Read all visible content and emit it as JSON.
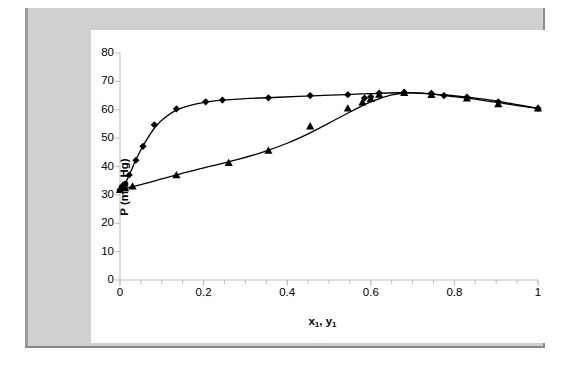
{
  "chart_data": {
    "type": "scatter",
    "title": "",
    "xlabel": "x1, y1",
    "ylabel": "P (mm Hg)",
    "xlim": [
      0,
      1
    ],
    "ylim": [
      0,
      80
    ],
    "grid": false,
    "legend": "none",
    "x_ticks": [
      "0",
      "0.2",
      "0.4",
      "0.6",
      "0.8",
      "1"
    ],
    "x_tick_values": [
      0,
      0.2,
      0.4,
      0.6,
      0.8,
      1
    ],
    "x_minor_tick_step": 0.05,
    "y_ticks": [
      "0",
      "10",
      "20",
      "30",
      "40",
      "50",
      "60",
      "70",
      "80"
    ],
    "y_tick_values": [
      0,
      10,
      20,
      30,
      40,
      50,
      60,
      70,
      80
    ],
    "series": [
      {
        "name": "vapor (y1)",
        "marker": "diamond",
        "color": "#000000",
        "points": [
          [
            0.0,
            31.8
          ],
          [
            0.005,
            33.0
          ],
          [
            0.012,
            33.8
          ],
          [
            0.022,
            37.0
          ],
          [
            0.038,
            42.2
          ],
          [
            0.055,
            47.1
          ],
          [
            0.082,
            54.7
          ],
          [
            0.135,
            60.3
          ],
          [
            0.205,
            62.8
          ],
          [
            0.245,
            63.4
          ],
          [
            0.355,
            64.2
          ],
          [
            0.455,
            65.0
          ],
          [
            0.545,
            65.3
          ],
          [
            0.585,
            64.1
          ],
          [
            0.6,
            64.6
          ],
          [
            0.62,
            65.9
          ],
          [
            0.68,
            66.2
          ],
          [
            0.745,
            65.8
          ],
          [
            0.775,
            65.0
          ],
          [
            0.83,
            64.5
          ],
          [
            0.905,
            62.8
          ],
          [
            1.0,
            60.5
          ]
        ]
      },
      {
        "name": "liquid (x1)",
        "marker": "triangle",
        "color": "#000000",
        "points": [
          [
            0.0,
            31.8
          ],
          [
            0.012,
            32.4
          ],
          [
            0.03,
            33.0
          ],
          [
            0.135,
            37.0
          ],
          [
            0.26,
            41.3
          ],
          [
            0.355,
            45.6
          ],
          [
            0.455,
            54.2
          ],
          [
            0.545,
            60.5
          ],
          [
            0.58,
            62.6
          ],
          [
            0.6,
            63.9
          ],
          [
            0.62,
            65.4
          ],
          [
            0.68,
            66.0
          ],
          [
            0.745,
            65.3
          ],
          [
            0.83,
            64.0
          ],
          [
            0.905,
            62.0
          ],
          [
            1.0,
            60.5
          ]
        ]
      }
    ],
    "fit_curves": [
      {
        "name": "vapor-curve",
        "points": [
          [
            0.0,
            31.8
          ],
          [
            0.01,
            33.4
          ],
          [
            0.025,
            38.0
          ],
          [
            0.04,
            43.0
          ],
          [
            0.06,
            48.5
          ],
          [
            0.085,
            54.0
          ],
          [
            0.11,
            57.5
          ],
          [
            0.14,
            60.2
          ],
          [
            0.18,
            62.0
          ],
          [
            0.23,
            63.2
          ],
          [
            0.3,
            63.9
          ],
          [
            0.38,
            64.4
          ],
          [
            0.46,
            64.9
          ],
          [
            0.54,
            65.3
          ],
          [
            0.6,
            65.7
          ],
          [
            0.66,
            66.0
          ],
          [
            0.72,
            65.8
          ],
          [
            0.78,
            65.2
          ],
          [
            0.84,
            64.3
          ],
          [
            0.9,
            63.1
          ],
          [
            0.95,
            61.8
          ],
          [
            1.0,
            60.5
          ]
        ]
      },
      {
        "name": "liquid-curve",
        "points": [
          [
            0.0,
            31.8
          ],
          [
            0.05,
            33.6
          ],
          [
            0.1,
            35.6
          ],
          [
            0.16,
            38.0
          ],
          [
            0.22,
            40.2
          ],
          [
            0.28,
            42.4
          ],
          [
            0.34,
            45.0
          ],
          [
            0.4,
            48.2
          ],
          [
            0.45,
            51.5
          ],
          [
            0.5,
            55.3
          ],
          [
            0.55,
            59.2
          ],
          [
            0.6,
            62.8
          ],
          [
            0.65,
            65.2
          ],
          [
            0.69,
            66.0
          ],
          [
            0.74,
            65.6
          ],
          [
            0.8,
            64.6
          ],
          [
            0.86,
            63.5
          ],
          [
            0.92,
            62.2
          ],
          [
            0.96,
            61.3
          ],
          [
            1.0,
            60.5
          ]
        ]
      }
    ]
  }
}
